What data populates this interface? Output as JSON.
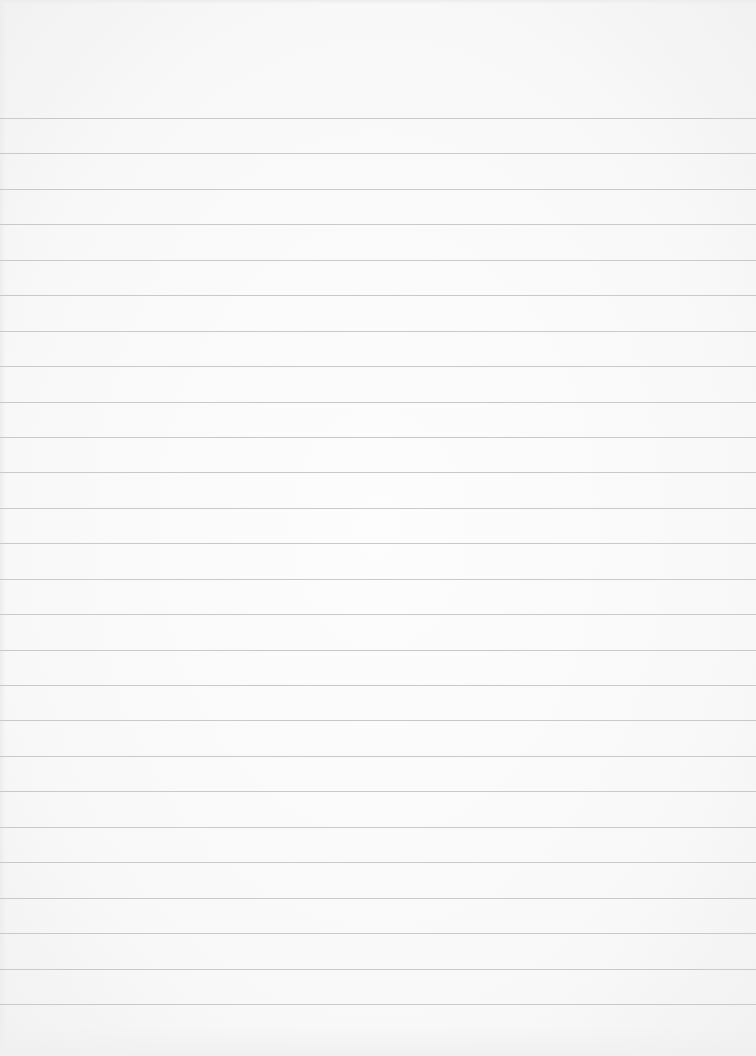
{
  "page": {
    "type": "ruled-paper",
    "background_color": "#f9f9f9",
    "line_color": "#c9c9c9",
    "line_count": 26,
    "first_line_y": 118,
    "line_spacing_px": 35.44,
    "text_content": []
  }
}
